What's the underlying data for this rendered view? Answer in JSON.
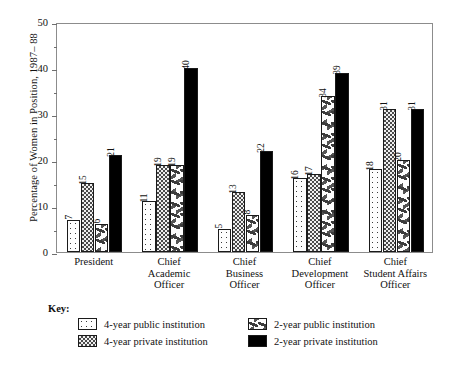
{
  "chart_data": {
    "type": "bar",
    "title": "",
    "xlabel": "",
    "ylabel": "Percentage of Women in Position, 1987– 88",
    "ylim": [
      0,
      50
    ],
    "yticks": [
      0,
      10,
      20,
      30,
      40,
      50
    ],
    "yminor": [
      5,
      15,
      25,
      35,
      45
    ],
    "grid": false,
    "legend_position": "bottom",
    "categories": [
      "President",
      "Chief Academic Officer",
      "Chief Business Officer",
      "Chief Development Officer",
      "Chief Student Affairs Officer"
    ],
    "category_lines": [
      [
        "President"
      ],
      [
        "Chief",
        "Academic",
        "Officer"
      ],
      [
        "Chief",
        "Business",
        "Officer"
      ],
      [
        "Chief",
        "Development",
        "Officer"
      ],
      [
        "Chief",
        "Student Affairs",
        "Officer"
      ]
    ],
    "series": [
      {
        "name": "4-year public institution",
        "pattern": "dots",
        "values": [
          7,
          11,
          5,
          16,
          18
        ]
      },
      {
        "name": "4-year private institution",
        "pattern": "check",
        "values": [
          15,
          19,
          13,
          17,
          31
        ]
      },
      {
        "name": "2-year public institution",
        "pattern": "dash",
        "values": [
          6,
          19,
          8,
          34,
          20
        ]
      },
      {
        "name": "2-year private institution",
        "pattern": "solid",
        "values": [
          21,
          40,
          22,
          39,
          31
        ]
      }
    ]
  },
  "key": {
    "title": "Key:",
    "items": [
      {
        "label": "4-year public institution",
        "pattern": "dots"
      },
      {
        "label": "2-year public institution",
        "pattern": "dash"
      },
      {
        "label": "4-year private institution",
        "pattern": "check"
      },
      {
        "label": "2-year private institution",
        "pattern": "solid"
      }
    ]
  },
  "colors": {
    "axis": "#8c8c8c",
    "tick": "#6f6f6f",
    "text": "#111111",
    "solid_bar": "#000000",
    "background": "#ffffff"
  }
}
